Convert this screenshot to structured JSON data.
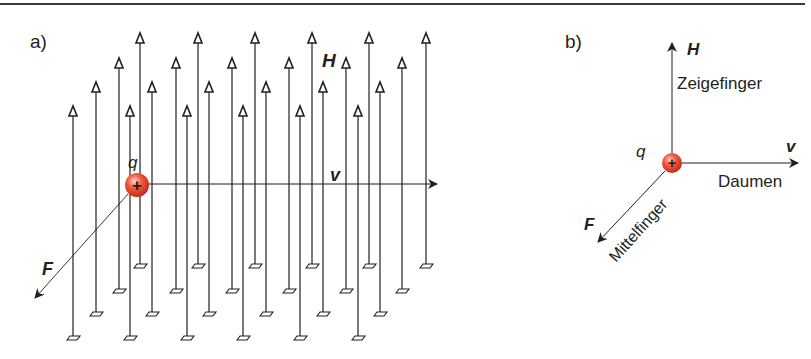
{
  "frame": {
    "top_rule_color": "#3a3a3a"
  },
  "panel_a": {
    "label": "a)",
    "H_label": "H",
    "v_label": "v",
    "F_label": "F",
    "q_label": "q",
    "charge_symbol": "+",
    "charge": {
      "cx": 137,
      "cy": 185,
      "r": 12
    },
    "v_arrow": {
      "x1": 149,
      "y": 184,
      "x2": 437
    },
    "F_arrow": {
      "x1": 128,
      "y1": 194,
      "x2": 33,
      "y2": 300
    },
    "field_rows": [
      {
        "top": 33,
        "bottom": 266,
        "xs": [
          140,
          198,
          255,
          312,
          369,
          426
        ]
      },
      {
        "top": 58,
        "bottom": 291,
        "xs": [
          119,
          176,
          232,
          289,
          346,
          402
        ]
      },
      {
        "top": 82,
        "bottom": 314,
        "xs": [
          96,
          152,
          209,
          266,
          323,
          380
        ]
      },
      {
        "top": 106,
        "bottom": 338,
        "xs": [
          73,
          130,
          187,
          243,
          300,
          358
        ]
      }
    ]
  },
  "panel_b": {
    "label": "b)",
    "H_label": "H",
    "v_label": "v",
    "F_label": "F",
    "q_label": "q",
    "charge_symbol": "+",
    "index_finger": "Zeigefinger",
    "thumb": "Daumen",
    "middle_finger": "Mittelfinger",
    "charge": {
      "cx": 672,
      "cy": 163,
      "r": 10
    }
  },
  "colors": {
    "line": "#231f20",
    "charge_fill": "#e8422e",
    "charge_highlight": "#ffb3a3",
    "charge_border": "#c8301f"
  }
}
